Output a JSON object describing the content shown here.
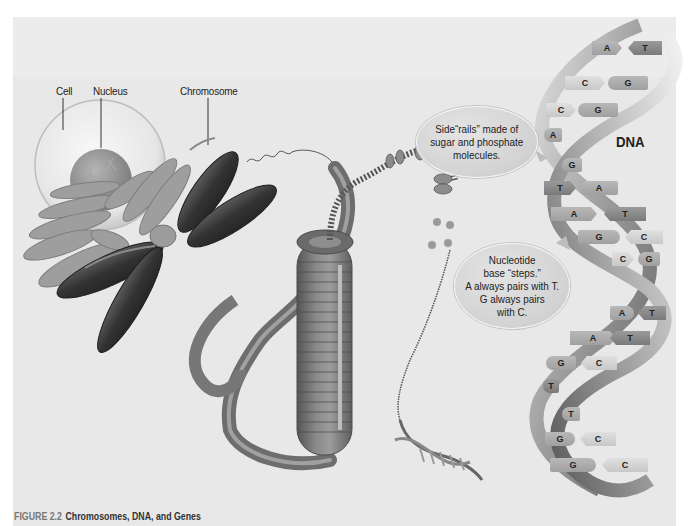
{
  "figure": {
    "number_label": "FIGURE 2.2",
    "title": "Chromosomes, DNA, and Genes"
  },
  "labels": {
    "cell": "Cell",
    "nucleus": "Nucleus",
    "chromosome": "Chromosome",
    "dna": "DNA"
  },
  "callouts": {
    "side_rails": "Side“rails” made of\nsugar and phosphate\nmolecules.",
    "nucleotide": "Nucleotide\nbase “steps.”\nA always pairs with T.\nG always pairs\nwith C."
  },
  "dna_base_pairs": [
    {
      "left": "A",
      "right": "T"
    },
    {
      "left": "C",
      "right": "G"
    },
    {
      "left": "C",
      "right": "G"
    },
    {
      "left": "A",
      "right": ""
    },
    {
      "left": "G",
      "right": ""
    },
    {
      "left": "T",
      "right": "A"
    },
    {
      "left": "A",
      "right": "T"
    },
    {
      "left": "G",
      "right": "C"
    },
    {
      "left": "C",
      "right": "G"
    },
    {
      "left": "A",
      "right": "T"
    },
    {
      "left": "A",
      "right": "T"
    },
    {
      "left": "G",
      "right": "C"
    },
    {
      "left": "T",
      "right": ""
    },
    {
      "left": "T",
      "right": ""
    },
    {
      "left": "G",
      "right": "C"
    },
    {
      "left": "G",
      "right": "C"
    }
  ],
  "colors": {
    "page_background": "#ffffff",
    "panel_background": "#e8e8e8",
    "chromosome_dark": "#3a3a3a",
    "chromosome_light": "#9a9a9a",
    "fiber": "#7c7c7c",
    "text": "#222222",
    "caption_figure_number": "#777777"
  }
}
